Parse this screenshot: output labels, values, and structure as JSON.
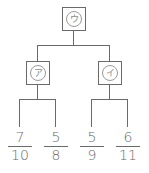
{
  "tree": {
    "root": {
      "label": "ウ"
    },
    "left": {
      "label": "ア"
    },
    "right": {
      "label": "イ"
    },
    "leaves": [
      {
        "numerator": "7",
        "denominator": "10"
      },
      {
        "numerator": "5",
        "denominator": "8"
      },
      {
        "numerator": "5",
        "denominator": "9"
      },
      {
        "numerator": "6",
        "denominator": "11"
      }
    ]
  },
  "colors": {
    "line": "#6a6a6a",
    "text": "#6a6a6a"
  }
}
